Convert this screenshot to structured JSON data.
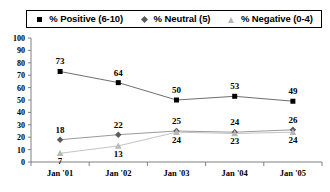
{
  "legend": {
    "entries": [
      {
        "label": "% Positive (6-10)",
        "marker": "square-marker",
        "color": "#000000"
      },
      {
        "label": "% Neutral (5)",
        "marker": "diamond-marker",
        "color": "#5a5a5a"
      },
      {
        "label": "% Negative (0-4)",
        "marker": "triangle-marker",
        "color": "#b8b8b8"
      }
    ]
  },
  "axis": {
    "y_ticks": [
      "100",
      "90",
      "80",
      "70",
      "60",
      "50",
      "40",
      "30",
      "20",
      "10",
      "0"
    ],
    "x_ticks": [
      "Jan '01",
      "Jan '02",
      "Jan '03",
      "Jan '04",
      "Jan '05"
    ]
  },
  "labels": {
    "positive": [
      "73",
      "64",
      "50",
      "53",
      "49"
    ],
    "neutral": [
      "18",
      "22",
      "25",
      "24",
      "26"
    ],
    "negative": [
      "7",
      "13",
      "24",
      "23",
      "24"
    ]
  },
  "chart_data": {
    "type": "line",
    "title": "",
    "xlabel": "",
    "ylabel": "",
    "ylim": [
      0,
      100
    ],
    "ytick_step": 10,
    "grid": false,
    "legend_position": "top",
    "categories": [
      "Jan '01",
      "Jan '02",
      "Jan '03",
      "Jan '04",
      "Jan '05"
    ],
    "series": [
      {
        "name": "% Positive (6-10)",
        "marker": "square",
        "color": "#000000",
        "values": [
          73,
          64,
          50,
          53,
          49
        ]
      },
      {
        "name": "% Neutral (5)",
        "marker": "diamond",
        "color": "#5a5a5a",
        "values": [
          18,
          22,
          25,
          24,
          26
        ]
      },
      {
        "name": "% Negative (0-4)",
        "marker": "triangle",
        "color": "#b8b8b8",
        "values": [
          7,
          13,
          24,
          23,
          24
        ]
      }
    ]
  }
}
